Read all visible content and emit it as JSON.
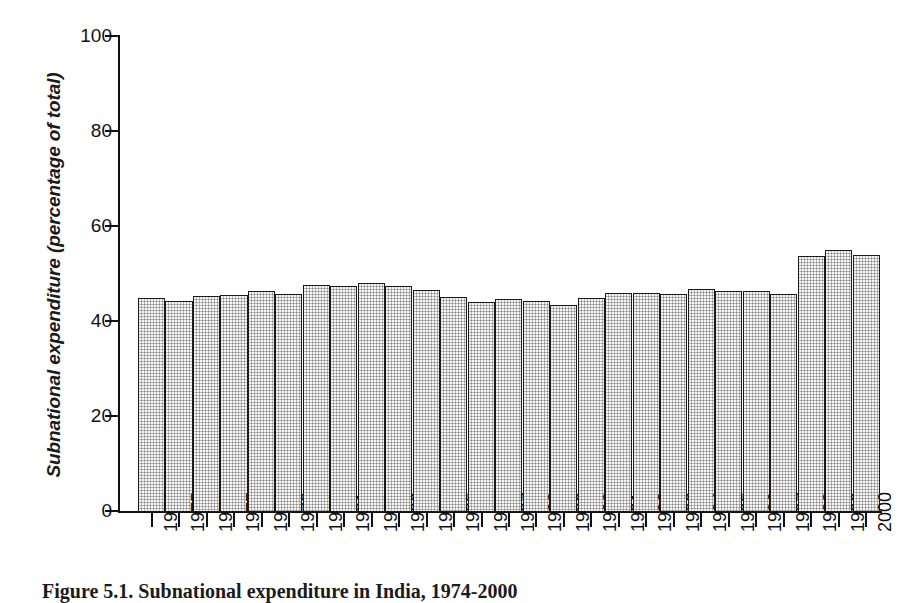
{
  "figure": {
    "caption": "Figure 5.1. Subnational expenditure in India, 1974-2000",
    "background_color": "#ffffff"
  },
  "chart_data": {
    "type": "bar",
    "title": "Figure 5.1. Subnational expenditure in India, 1974-2000",
    "xlabel": "",
    "ylabel": "Subnational expenditure (percentage of total)",
    "ylim": [
      0,
      100
    ],
    "yticks": [
      0,
      20,
      40,
      60,
      80,
      100
    ],
    "ytick_labels": [
      "0",
      "20",
      "40",
      "60",
      "80",
      "100"
    ],
    "grid": false,
    "legend": false,
    "bar_fill_color": "#b8b8b8",
    "bar_edge_color": "#1a1a1a",
    "categories": [
      "1974",
      "1975",
      "1976",
      "1977",
      "1978",
      "1979",
      "1980",
      "1981",
      "1982",
      "1983",
      "1984",
      "1985",
      "1986",
      "1987",
      "1988",
      "1989",
      "1990",
      "1991",
      "1992",
      "1993",
      "1994",
      "1995",
      "1996",
      "1997",
      "1998",
      "1999",
      "2000"
    ],
    "values": [
      45.0,
      44.5,
      45.5,
      45.7,
      46.5,
      46.0,
      47.8,
      47.5,
      48.3,
      47.5,
      46.8,
      45.3,
      44.3,
      44.8,
      44.4,
      43.6,
      45.1,
      46.2,
      46.2,
      46.0,
      47.0,
      46.5,
      46.6,
      46.0,
      53.8,
      55.2,
      54.2
    ]
  }
}
